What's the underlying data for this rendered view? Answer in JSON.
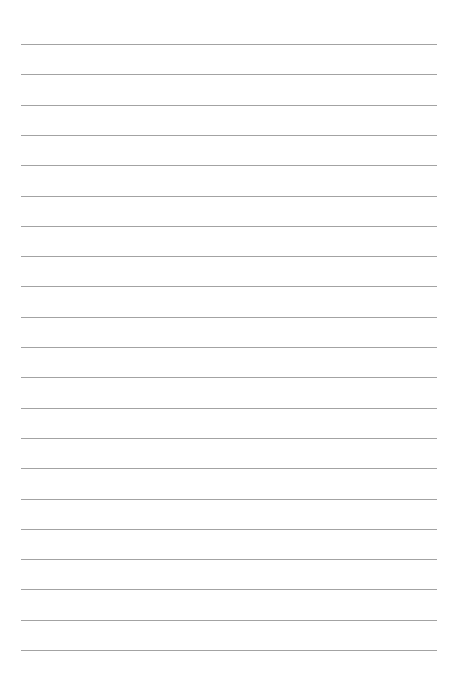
{
  "page": {
    "type": "lined-paper",
    "background_color": "#ffffff",
    "line_color": "#a3a3a3",
    "line_count": 21,
    "first_line_y": 44,
    "line_spacing": 30.3,
    "line_left": 21,
    "line_width": 416
  }
}
